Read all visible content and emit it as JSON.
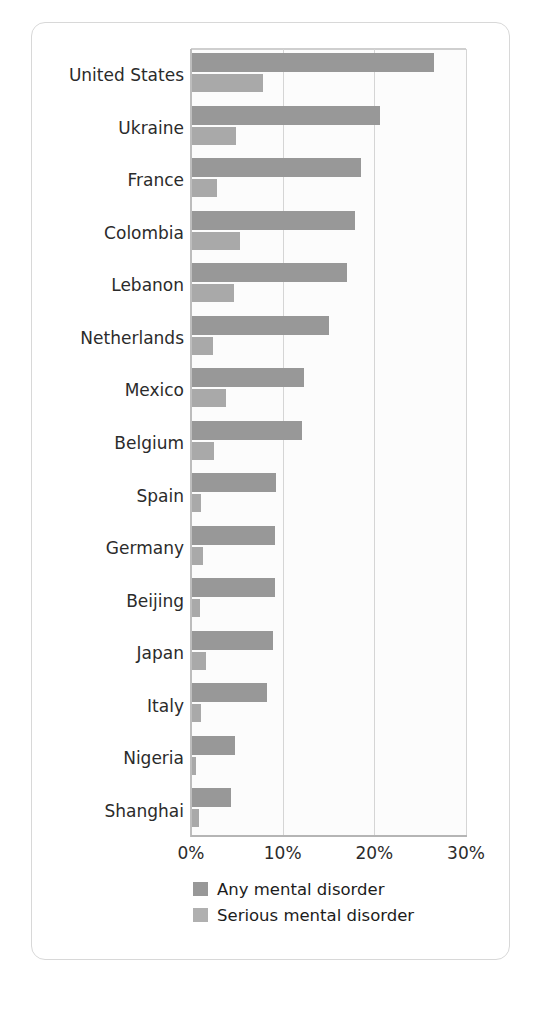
{
  "chart_data": {
    "type": "bar",
    "orientation": "horizontal",
    "title": "",
    "subtitle": "",
    "xlabel": "",
    "ylabel": "",
    "xlim": [
      0,
      30
    ],
    "xticks": [
      0,
      10,
      20,
      30
    ],
    "xtick_labels": [
      "0%",
      "10%",
      "20%",
      "30%"
    ],
    "grid": "vertical",
    "legend_position": "bottom-left",
    "categories": [
      "United States",
      "Ukraine",
      "France",
      "Colombia",
      "Lebanon",
      "Netherlands",
      "Mexico",
      "Belgium",
      "Spain",
      "Germany",
      "Beijing",
      "Japan",
      "Italy",
      "Nigeria",
      "Shanghai"
    ],
    "series": [
      {
        "name": "Any mental disorder",
        "color": "#989898",
        "values": [
          26.4,
          20.5,
          18.4,
          17.8,
          16.9,
          14.9,
          12.2,
          12.0,
          9.2,
          9.1,
          9.1,
          8.8,
          8.2,
          4.7,
          4.3
        ]
      },
      {
        "name": "Serious mental disorder",
        "color": "#a9a9a9",
        "values": [
          7.7,
          4.8,
          2.7,
          5.2,
          4.6,
          2.3,
          3.7,
          2.4,
          1.0,
          1.2,
          0.9,
          1.5,
          1.0,
          0.4,
          0.8
        ]
      }
    ]
  },
  "legend": {
    "items": [
      {
        "label": "Any mental disorder",
        "swatch_class": "any"
      },
      {
        "label": "Serious mental disorder",
        "swatch_class": "serious"
      }
    ]
  },
  "colors": {
    "any_mental_disorder": "#989898",
    "serious_mental_disorder": "#a9a9a9",
    "gridline": "#d5d5d5",
    "axis": "#b5b5b5",
    "card_border": "#d8d8d8",
    "text": "#2b2b2b",
    "plot_background": "#fcfcfc"
  }
}
